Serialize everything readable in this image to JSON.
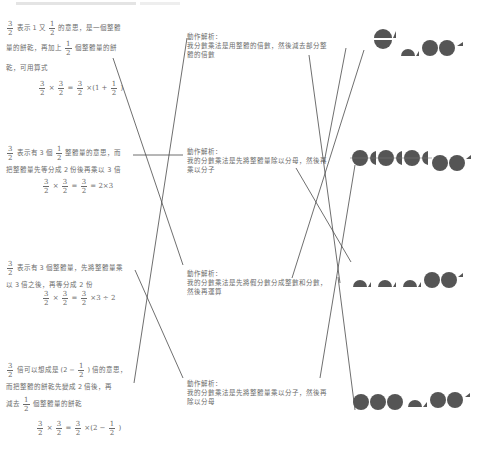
{
  "left_items": [
    {
      "line1_pre": "表示 1 又",
      "line1_post": "的意思，是一個整體",
      "line2_pre": "量的餅乾，再加上",
      "line2_post": "個整體量的餅",
      "line3": "乾，可用算式",
      "equation_tail": "×(1 +",
      "equation_close": ")"
    },
    {
      "line1_pre": "表示有 3 個",
      "line1_post": "整體量的意思，而",
      "line2": "把整體量先等分成 2 份後再乘以 3 倍",
      "equation_tail": "= 2×3"
    },
    {
      "line1": "表示有 3 個整體量，先將整體量乘",
      "line2": "以 3 倍之後，再等分成 2 份",
      "equation_tail": "×3 ÷ 2"
    },
    {
      "line1_pre": "倍可以想成是 (2 −",
      "line1_post": ") 倍的意思，",
      "line2": "而把整體的餅乾先變成 2 倍後，再",
      "line3_pre": "減去",
      "line3_post": "個整體量的餅乾",
      "equation_tail": "×(2 −",
      "equation_close": ")"
    }
  ],
  "fractions": {
    "three_halves": {
      "n": "3",
      "d": "2"
    },
    "half": {
      "n": "1",
      "d": "2"
    }
  },
  "operators": {
    "times": "×",
    "equals": "="
  },
  "middle_items": [
    {
      "title": "動作解析：",
      "body": "我分數乘法是用整體的倍數，然後減去部分整體的倍數"
    },
    {
      "title": "動作解析：",
      "body": "我的分數乘法是先將整體量除以分母，然後再乘以分子"
    },
    {
      "title": "動作解析：",
      "body": "我的分數乘法是先將假分數分成整數和分數，然後再運算"
    },
    {
      "title": "動作解析：",
      "body": "我的分數乘法是先將整體量乘以分子，然後再除以分母"
    }
  ],
  "right_items": [
    {
      "name": "pattern-1",
      "shapes": [
        "split-circle",
        "half-top",
        "half-top",
        "circle",
        "circle",
        "quarter"
      ]
    },
    {
      "name": "pattern-2",
      "shapes": [
        "circle-split",
        "circle-split",
        "circle-split",
        "circle",
        "circle",
        "quarter"
      ]
    },
    {
      "name": "pattern-3",
      "shapes": [
        "half-top",
        "half-top",
        "half-top",
        "circle",
        "circle",
        "quarter"
      ]
    },
    {
      "name": "pattern-4",
      "shapes": [
        "circle",
        "circle",
        "circle",
        "half-top",
        "circle",
        "circle",
        "quarter"
      ]
    }
  ],
  "colors": {
    "text": "#6a6a6a",
    "line": "#4a4a4a",
    "shape": "#555555"
  }
}
